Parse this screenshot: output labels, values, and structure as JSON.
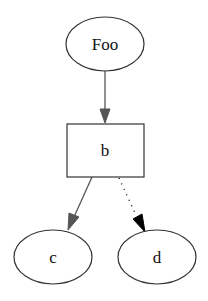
{
  "diagram": {
    "type": "directed-graph",
    "nodes": [
      {
        "id": "Foo",
        "label": "Foo",
        "shape": "ellipse"
      },
      {
        "id": "b",
        "label": "b",
        "shape": "box"
      },
      {
        "id": "c",
        "label": "c",
        "shape": "ellipse"
      },
      {
        "id": "d",
        "label": "d",
        "shape": "ellipse"
      }
    ],
    "edges": [
      {
        "from": "Foo",
        "to": "b",
        "style": "solid",
        "color": "#555555"
      },
      {
        "from": "b",
        "to": "c",
        "style": "solid",
        "color": "#555555"
      },
      {
        "from": "b",
        "to": "d",
        "style": "dotted",
        "color": "#000000"
      }
    ]
  },
  "colors": {
    "node_stroke": "#333333",
    "edge_grey": "#555555",
    "edge_black": "#000000",
    "background": "#ffffff"
  }
}
